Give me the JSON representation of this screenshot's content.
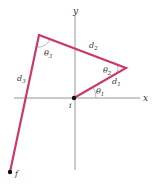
{
  "diagram": {
    "axes": {
      "x_label": "x",
      "y_label": "y",
      "color": "#8a8a8a"
    },
    "path_color": "#c83a6e",
    "points": {
      "start": {
        "label": "i",
        "x": 74,
        "y": 98
      },
      "p1": {
        "x": 126,
        "y": 68
      },
      "p2": {
        "x": 39,
        "y": 35
      },
      "end": {
        "label": "f",
        "x": 10,
        "y": 172
      }
    },
    "segments": [
      {
        "label": "d",
        "sub": "1"
      },
      {
        "label": "d",
        "sub": "2"
      },
      {
        "label": "d",
        "sub": "3"
      }
    ],
    "angles": [
      {
        "label": "θ",
        "sub": "1"
      },
      {
        "label": "θ",
        "sub": "2"
      },
      {
        "label": "θ",
        "sub": "3"
      }
    ]
  }
}
